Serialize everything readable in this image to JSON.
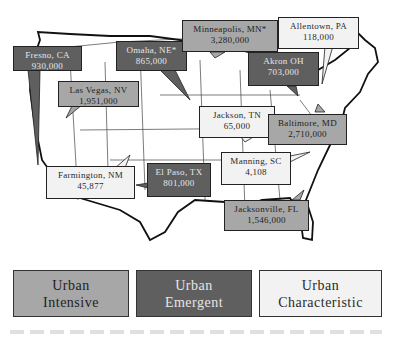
{
  "figure": {
    "type": "annotated-map",
    "region": "United States"
  },
  "colors": {
    "urban_intensive": "#a7a7a7",
    "urban_emergent": "#5f5f5f",
    "urban_characteristic": "#f2f2f2",
    "outline": "#222222"
  },
  "callouts": [
    {
      "city": "Fresno, CA",
      "population": "930,000",
      "category": "Urban Emergent"
    },
    {
      "city": "Omaha, NE*",
      "population": "865,000",
      "category": "Urban Emergent"
    },
    {
      "city": "Minneapolis, MN*",
      "population": "3,280,000",
      "category": "Urban Intensive"
    },
    {
      "city": "Allentown, PA",
      "population": "118,000",
      "category": "Urban Characteristic"
    },
    {
      "city": "Akron OH",
      "population": "703,000",
      "category": "Urban Emergent"
    },
    {
      "city": "Las Vegas, NV",
      "population": "1,951,000",
      "category": "Urban Intensive"
    },
    {
      "city": "Jackson, TN",
      "population": "65,000",
      "category": "Urban Characteristic"
    },
    {
      "city": "Baltimore, MD",
      "population": "2,710,000",
      "category": "Urban Intensive"
    },
    {
      "city": "Manning, SC",
      "population": "4,108",
      "category": "Urban Characteristic"
    },
    {
      "city": "Farmington, NM",
      "population": "45,877",
      "category": "Urban Characteristic"
    },
    {
      "city": "El Paso, TX",
      "population": "801,000",
      "category": "Urban Emergent"
    },
    {
      "city": "Jacksonville, FL",
      "population": "1,546,000",
      "category": "Urban Intensive"
    }
  ],
  "legend": [
    {
      "line1": "Urban",
      "line2": "Intensive"
    },
    {
      "line1": "Urban",
      "line2": "Emergent"
    },
    {
      "line1": "Urban",
      "line2": "Characteristic"
    }
  ]
}
